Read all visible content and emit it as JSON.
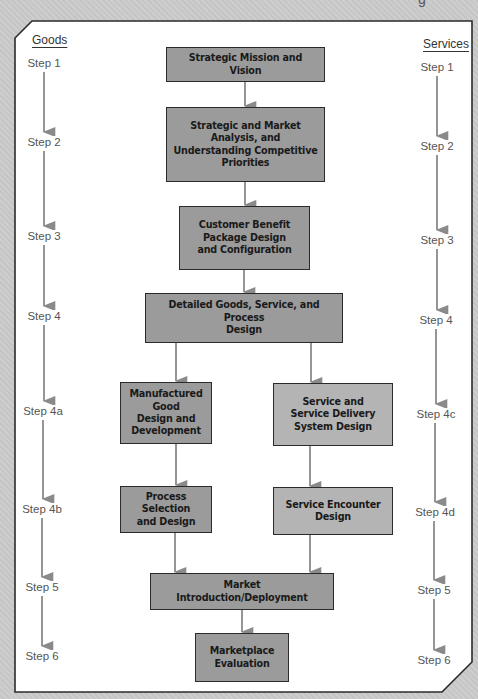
{
  "diagram": {
    "top_cut_text": "g",
    "columns": {
      "left_header": "Goods",
      "right_header": "Services"
    },
    "goods_steps": [
      {
        "label": "Step 1",
        "y": 63
      },
      {
        "label": "Step 2",
        "y": 142
      },
      {
        "label": "Step 3",
        "y": 236
      },
      {
        "label": "Step 4",
        "y": 316
      },
      {
        "label": "Step 4a",
        "y": 411
      },
      {
        "label": "Step 4b",
        "y": 509
      },
      {
        "label": "Step 5",
        "y": 587
      },
      {
        "label": "Step 6",
        "y": 656
      }
    ],
    "services_steps": [
      {
        "label": "Step 1",
        "y": 67
      },
      {
        "label": "Step 2",
        "y": 146
      },
      {
        "label": "Step 3",
        "y": 240
      },
      {
        "label": "Step 4",
        "y": 320
      },
      {
        "label": "Step 4c",
        "y": 414
      },
      {
        "label": "Step 4d",
        "y": 512
      },
      {
        "label": "Step 5",
        "y": 590
      },
      {
        "label": "Step 6",
        "y": 660
      }
    ],
    "boxes": {
      "mission": {
        "text": "Strategic Mission and Vision"
      },
      "analysis": {
        "text": "Strategic and Market\nAnalysis, and\nUnderstanding Competitive\nPriorities"
      },
      "cbp": {
        "text": "Customer Benefit\nPackage Design\nand Configuration"
      },
      "detailed": {
        "text": "Detailed Goods, Service, and Process\nDesign"
      },
      "manufactured": {
        "text": "Manufactured Good\nDesign and\nDevelopment"
      },
      "service_delivery": {
        "text": "Service and\nService Delivery\nSystem Design"
      },
      "process_selection": {
        "text": "Process Selection\nand Design"
      },
      "service_encounter": {
        "text": "Service Encounter\nDesign"
      },
      "market_intro": {
        "text": "Market Introduction/Deployment"
      },
      "marketplace_eval": {
        "text": "Marketplace\nEvaluation"
      }
    },
    "colors": {
      "goods_box": "#9b9b9b",
      "services_box": "#b4b4b4",
      "arrow": "#8a8a8a",
      "border": "#2b2b2b",
      "panel_bg": "#ffffff",
      "page_bg": "#cbcbcb"
    }
  }
}
